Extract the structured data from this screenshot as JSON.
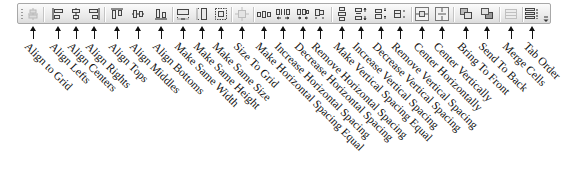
{
  "toolbar": {
    "name": "Layout toolbar",
    "buttons": [
      {
        "id": "align-to-grid",
        "label": "Align to Grid",
        "icon": "align-to-grid-icon",
        "enabled": false
      },
      {
        "id": "align-lefts",
        "label": "Align Lefts",
        "icon": "align-lefts-icon",
        "enabled": true
      },
      {
        "id": "align-centers",
        "label": "Align Centers",
        "icon": "align-centers-icon",
        "enabled": true
      },
      {
        "id": "align-rights",
        "label": "Align Rights",
        "icon": "align-rights-icon",
        "enabled": true
      },
      {
        "id": "align-tops",
        "label": "Align Tops",
        "icon": "align-tops-icon",
        "enabled": true
      },
      {
        "id": "align-middles",
        "label": "Align Middles",
        "icon": "align-middles-icon",
        "enabled": true
      },
      {
        "id": "align-bottoms",
        "label": "Align Bottoms",
        "icon": "align-bottoms-icon",
        "enabled": true
      },
      {
        "id": "make-same-width",
        "label": "Make Same Width",
        "icon": "make-same-width-icon",
        "enabled": true
      },
      {
        "id": "make-same-height",
        "label": "Make Same Height",
        "icon": "make-same-height-icon",
        "enabled": true
      },
      {
        "id": "make-same-size",
        "label": "Make Same Size",
        "icon": "make-same-size-icon",
        "enabled": true
      },
      {
        "id": "size-to-grid",
        "label": "Size To Grid",
        "icon": "size-to-grid-icon",
        "enabled": false
      },
      {
        "id": "make-horizontal-spacing-equal",
        "label": "Make Horizontal Spacing Equal",
        "icon": "make-horizontal-spacing-equal-icon",
        "enabled": true
      },
      {
        "id": "increase-horizontal-spacing",
        "label": "Increase Horizontal Spacing",
        "icon": "increase-horizontal-spacing-icon",
        "enabled": true
      },
      {
        "id": "decrease-horizontal-spacing",
        "label": "Decrease Horizontal Spacing",
        "icon": "decrease-horizontal-spacing-icon",
        "enabled": true
      },
      {
        "id": "remove-horizontal-spacing",
        "label": "Remove Horizontal Spacing",
        "icon": "remove-horizontal-spacing-icon",
        "enabled": true
      },
      {
        "id": "make-vertical-spacing-equal",
        "label": "Make Vertical Spacing Equal",
        "icon": "make-vertical-spacing-equal-icon",
        "enabled": true
      },
      {
        "id": "increase-vertical-spacing",
        "label": "Increase Vertical Spacing",
        "icon": "increase-vertical-spacing-icon",
        "enabled": true
      },
      {
        "id": "decrease-vertical-spacing",
        "label": "Decrease Vertical Spacing",
        "icon": "decrease-vertical-spacing-icon",
        "enabled": true
      },
      {
        "id": "remove-vertical-spacing",
        "label": "Remove Vertical Spacing",
        "icon": "remove-vertical-spacing-icon",
        "enabled": true
      },
      {
        "id": "center-horizontally",
        "label": "Center Horizontally",
        "icon": "center-horizontally-icon",
        "enabled": true
      },
      {
        "id": "center-vertically",
        "label": "Center Vertically",
        "icon": "center-vertically-icon",
        "enabled": true
      },
      {
        "id": "bring-to-front",
        "label": "Bring To Front",
        "icon": "bring-to-front-icon",
        "enabled": true
      },
      {
        "id": "send-to-back",
        "label": "Send To Back",
        "icon": "send-to-back-icon",
        "enabled": true
      },
      {
        "id": "merge-cells",
        "label": "Merge Cells",
        "icon": "merge-cells-icon",
        "enabled": false
      },
      {
        "id": "tab-order",
        "label": "Tab Order",
        "icon": "tab-order-icon",
        "enabled": true
      }
    ],
    "overflow_icon": "toolbar-overflow-chevron-icon"
  }
}
